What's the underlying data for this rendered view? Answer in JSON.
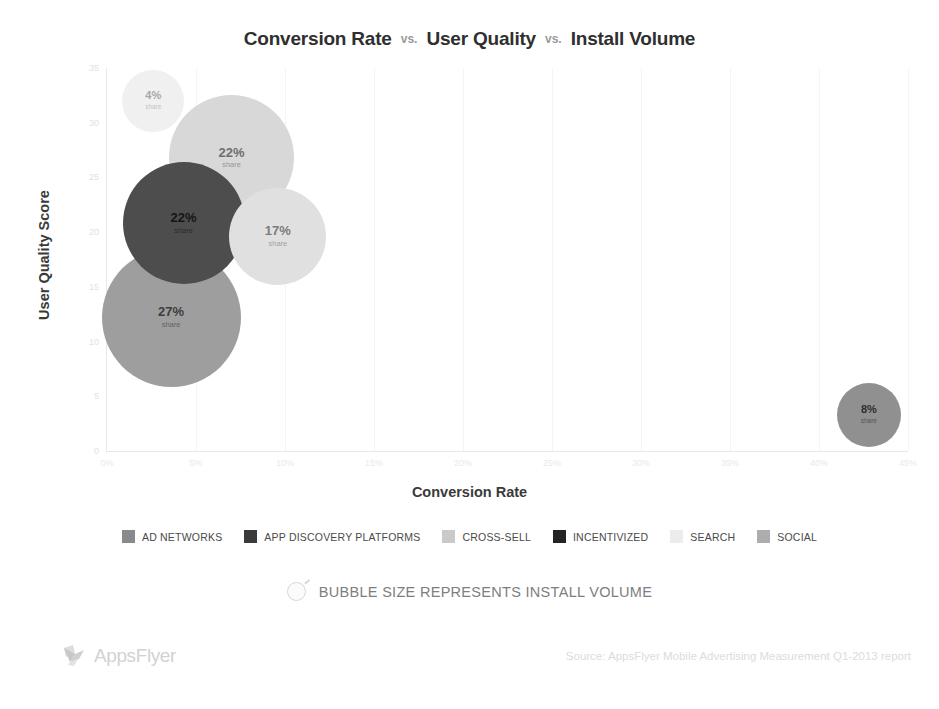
{
  "title": {
    "part1": "Conversion Rate",
    "sep1": "vs.",
    "part2": "User Quality",
    "sep2": "vs.",
    "part3": "Install Volume"
  },
  "axes": {
    "xlabel": "Conversion Rate",
    "ylabel": "User Quality Score",
    "xticks": [
      "0%",
      "5%",
      "10%",
      "15%",
      "20%",
      "25%",
      "30%",
      "35%",
      "40%",
      "45%"
    ],
    "yticks": [
      "0",
      "5",
      "10",
      "15",
      "20",
      "25",
      "30",
      "35"
    ]
  },
  "legend": {
    "items": [
      {
        "label": "AD NETWORKS",
        "color": "#8a8a8a"
      },
      {
        "label": "APP DISCOVERY PLATFORMS",
        "color": "#3a3a3a"
      },
      {
        "label": "CROSS-SELL",
        "color": "#c9c9c9"
      },
      {
        "label": "INCENTIVIZED",
        "color": "#242424"
      },
      {
        "label": "SEARCH",
        "color": "#ececec"
      },
      {
        "label": "SOCIAL",
        "color": "#adadad"
      }
    ]
  },
  "size_note": {
    "icon": "bubble-outline-icon",
    "text": "BUBBLE SIZE REPRESENTS INSTALL VOLUME"
  },
  "footer": {
    "logo_text": "AppsFlyer",
    "logo_icon": "appsflyer-bird-icon",
    "source": "Source: AppsFlyer Mobile Advertising Measurement Q1-2013 report"
  },
  "chart_data": {
    "type": "scatter",
    "xlabel": "Conversion Rate",
    "ylabel": "User Quality Score",
    "xlim": [
      0,
      45
    ],
    "ylim": [
      0,
      35
    ],
    "xtick_step": 5,
    "ytick_step": 5,
    "grid": true,
    "legend_position": "bottom",
    "size_encodes": "Install Volume",
    "points": [
      {
        "name": "SEARCH",
        "x": 2.6,
        "y": 32.0,
        "share_label": "4%",
        "share_sub": "share",
        "size_px": 62,
        "color": "#f0f0f0",
        "text_color": "#a8a8a8"
      },
      {
        "name": "CROSS-SELL",
        "x": 7.0,
        "y": 26.8,
        "share_label": "22%",
        "share_sub": "share",
        "size_px": 125,
        "color": "#d8d8d8",
        "text_color": "#6e6e6e"
      },
      {
        "name": "INCENTIVIZED",
        "x": 4.3,
        "y": 20.8,
        "share_label": "22%",
        "share_sub": "share",
        "size_px": 122,
        "color": "#4d4d4d",
        "text_color": "#151515"
      },
      {
        "name": "AD NETWORKS",
        "x": 9.6,
        "y": 19.6,
        "share_label": "17%",
        "share_sub": "share",
        "size_px": 97,
        "color": "#e0e0e0",
        "text_color": "#7c7c7c"
      },
      {
        "name": "SOCIAL",
        "x": 3.6,
        "y": 12.2,
        "share_label": "27%",
        "share_sub": "share",
        "size_px": 139,
        "color": "#9e9e9e",
        "text_color": "#3d3d3d"
      },
      {
        "name": "APP DISCOVERY PLATFORMS",
        "x": 42.8,
        "y": 3.3,
        "share_label": "8%",
        "share_sub": "share",
        "size_px": 64,
        "color": "#909090",
        "text_color": "#2e2e2e"
      }
    ]
  }
}
